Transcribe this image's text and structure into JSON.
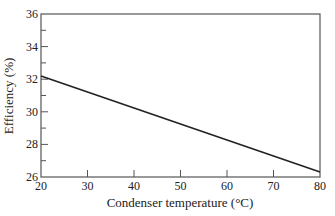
{
  "chart_data": {
    "type": "line",
    "title": "",
    "xlabel": "Condenser temperature (°C)",
    "ylabel": "Efficiency (%)",
    "xlim": [
      20,
      80
    ],
    "ylim": [
      26,
      36
    ],
    "x_ticks": [
      20,
      30,
      40,
      50,
      60,
      70,
      80
    ],
    "y_ticks": [
      26,
      28,
      30,
      32,
      34,
      36
    ],
    "y_minor_ticks": [
      27,
      29,
      31,
      33,
      35
    ],
    "grid": false,
    "legend": null,
    "series": [
      {
        "name": "Efficiency",
        "x": [
          20,
          80
        ],
        "values": [
          32.2,
          26.3
        ]
      }
    ]
  },
  "colors": {
    "line": "#222222",
    "frame": "#555555"
  }
}
